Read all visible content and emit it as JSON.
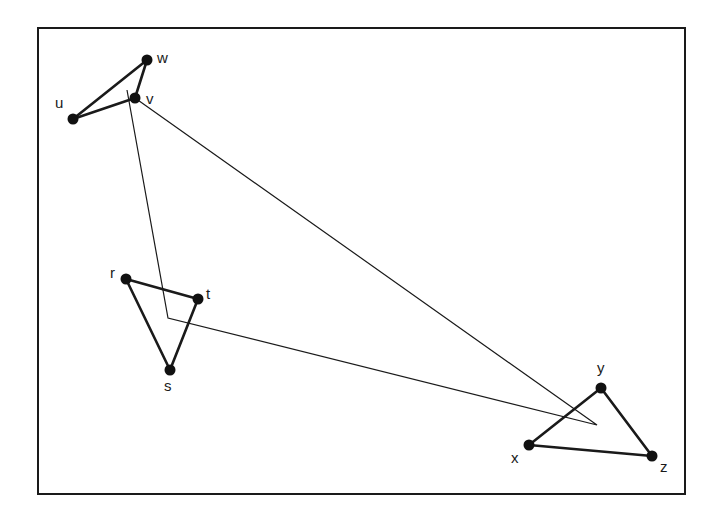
{
  "diagram": {
    "type": "graph-with-clustered-triangles",
    "frame": {
      "x": 38,
      "y": 28,
      "width": 647,
      "height": 466
    },
    "nodes": [
      {
        "id": "w",
        "label": "w",
        "x": 147,
        "y": 60,
        "lx": 157,
        "ly": 63
      },
      {
        "id": "v",
        "label": "v",
        "x": 135,
        "y": 98,
        "lx": 146,
        "ly": 104
      },
      {
        "id": "u",
        "label": "u",
        "x": 73,
        "y": 119,
        "lx": 55,
        "ly": 108
      },
      {
        "id": "r",
        "label": "r",
        "x": 126,
        "y": 279,
        "lx": 110,
        "ly": 278
      },
      {
        "id": "t",
        "label": "t",
        "x": 198,
        "y": 299,
        "lx": 206,
        "ly": 299
      },
      {
        "id": "s",
        "label": "s",
        "x": 170,
        "y": 370,
        "lx": 164,
        "ly": 391
      },
      {
        "id": "y",
        "label": "y",
        "x": 601,
        "y": 388,
        "lx": 597,
        "ly": 373
      },
      {
        "id": "x",
        "label": "x",
        "x": 529,
        "y": 445,
        "lx": 511,
        "ly": 463
      },
      {
        "id": "z",
        "label": "z",
        "x": 652,
        "y": 456,
        "lx": 660,
        "ly": 472
      }
    ],
    "edges": [
      [
        "u",
        "w"
      ],
      [
        "w",
        "v"
      ],
      [
        "u",
        "v"
      ],
      [
        "r",
        "t"
      ],
      [
        "r",
        "s"
      ],
      [
        "s",
        "t"
      ],
      [
        "x",
        "y"
      ],
      [
        "y",
        "z"
      ],
      [
        "x",
        "z"
      ]
    ],
    "cluster_path": {
      "description": "thin triangle connecting cluster centroids",
      "points": [
        [
          127,
          90
        ],
        [
          168,
          318
        ],
        [
          597,
          425
        ],
        [
          135,
          98
        ]
      ]
    }
  }
}
